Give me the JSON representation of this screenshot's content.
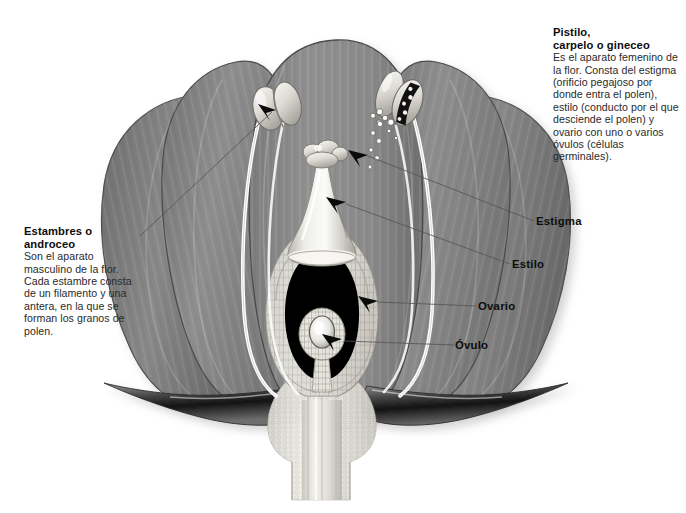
{
  "figure": {
    "palette": {
      "background": "#ffffff",
      "petal_fill": "#8b8b8b",
      "petal_fill_dark": "#6f6f6f",
      "petal_edge": "#4a4a4a",
      "filament": "#fdfdfd",
      "anther": "#e3e3e0",
      "ovary_wall": "#d5d4cf",
      "ovary_cavity": "#000000",
      "sepal_dark": "#1c1c1c",
      "receptacle": "#e7e6e1",
      "leader_line": "#5a5a5a",
      "text": "#111111"
    }
  },
  "callouts": {
    "pistilo": {
      "heading_line1": "Pistilo,",
      "heading_line2": "carpelo o gineceo",
      "body": "Es el aparato femenino de la flor. Consta del estigma (orificio pegajoso por donde entra el polen), estilo (conducto por el que desciende el polen) y ovario con uno o varios óvulos (células germinales).",
      "body_lines": [
        "Es el aparato femenino",
        "de la flor. Consta",
        "del estigma (orificio",
        "pegajoso por donde entra",
        "el polen), estilo (conducto",
        "por el que desciende el",
        "polen) y ovario con uno",
        "o varios óvulos",
        "(células germinales)."
      ]
    },
    "estambres": {
      "heading_line1": "Estambres o",
      "heading_line2": "androceo",
      "body": "Son el aparato masculino de la flor. Cada estambre consta de un filamento y una antera, en la que se forman los granos de polen.",
      "body_lines": [
        "Son el aparato",
        "masculino",
        "de la flor.",
        "Cada estambre",
        "consta",
        "de un filamento",
        "y una antera, en",
        "la que se forman",
        "los granos de",
        "polen."
      ]
    }
  },
  "labels": {
    "estigma": "Estigma",
    "estilo": "Estilo",
    "ovario": "Ovario",
    "ovulo": "Óvulo"
  },
  "parts": {
    "petals": "Pétalos (corola)",
    "sepals": "Sépalos",
    "receptacle": "Receptáculo y pedúnculo",
    "anther_closed": "Antera cerrada",
    "anther_open": "Antera dehiscente liberando polen",
    "pollen": "Granos de polen",
    "style": "Estilo",
    "stigma": "Estigma",
    "ovary": "Ovario",
    "ovule": "Óvulo"
  }
}
